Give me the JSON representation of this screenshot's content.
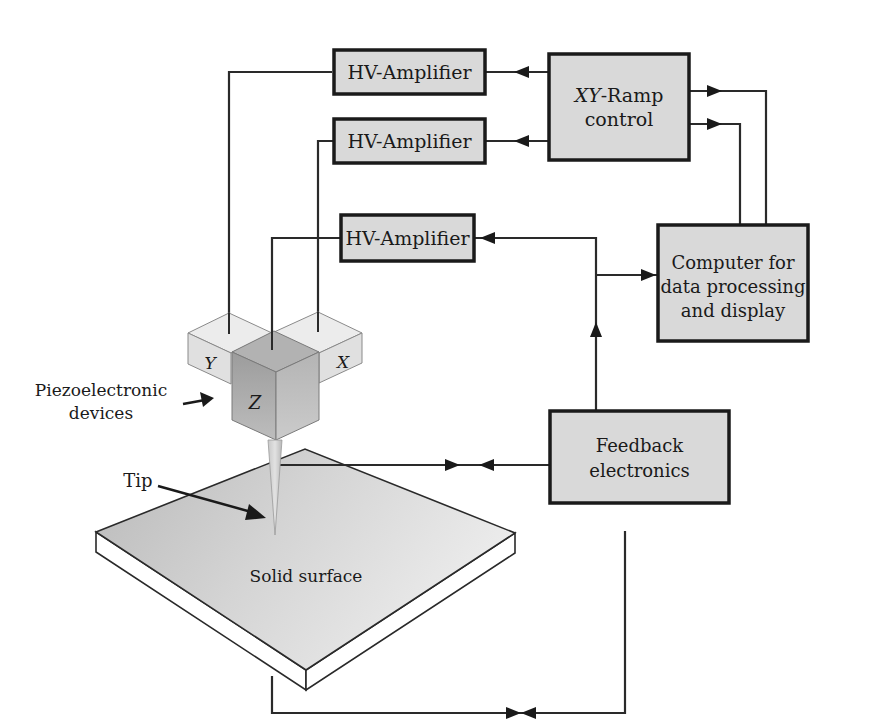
{
  "diagram": {
    "blocks": {
      "hv_amp_1": "HV-Amplifier",
      "hv_amp_2": "HV-Amplifier",
      "hv_amp_3": "HV-Amplifier",
      "xy_ramp_line1_italic": "XY",
      "xy_ramp_line1_rest": "-Ramp",
      "xy_ramp_line2": "control",
      "computer_line1": "Computer for",
      "computer_line2": "data processing",
      "computer_line3": "and display",
      "feedback_line1": "Feedback",
      "feedback_line2": "electronics"
    },
    "piezo": {
      "y_label": "Y",
      "x_label": "X",
      "z_label": "Z"
    },
    "annotations": {
      "piezo_line1": "Piezoelectronic",
      "piezo_line2": "devices",
      "tip": "Tip",
      "surface": "Solid surface",
      "iv": "I, V"
    },
    "colors": {
      "box_fill": "#d9d9d9",
      "line": "#1a1a1a",
      "cube_light": "#e4e4e4",
      "cube_dark": "#a8a8a8",
      "surface": "#cfcfcf"
    }
  }
}
